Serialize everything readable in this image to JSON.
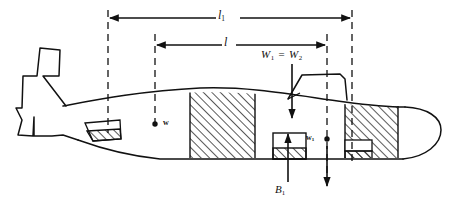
{
  "figure": {
    "background_color": "#ffffff",
    "line_color": "#111111",
    "hatch_color": "#1a1a1a"
  },
  "labels": {
    "length_overall": "l",
    "length_overall_sub": "1",
    "length_inner": "l",
    "weight_equation_lhs": "W",
    "weight_equation_lhs_sub": "1",
    "weight_equation_operator": "=",
    "weight_equation_rhs": "W",
    "weight_equation_rhs_sub": "2",
    "weight_center": "w",
    "weight_center_aft": "w",
    "weight_center_aft_sub": "1",
    "buoyancy": "B",
    "buoyancy_sub": "1"
  },
  "dimensions": {
    "overall_width_px": 451,
    "overall_height_px": 209,
    "dim_l1_left_x": 108,
    "dim_l1_right_x": 352,
    "dim_l1_y": 18,
    "dim_l_left_x": 155,
    "dim_l_right_x": 327,
    "dim_l_y": 45
  },
  "markers": [
    {
      "name": "center-of-weight-forward",
      "label": "w",
      "x": 155,
      "y": 124
    },
    {
      "name": "center-of-weight-aft",
      "label": "w1",
      "x": 327,
      "y": 139
    }
  ],
  "force_arrows": [
    {
      "name": "weight-arrow-down",
      "direction": "down",
      "x": 292,
      "from_y": 63,
      "to_y": 120
    },
    {
      "name": "weight-arrow-aft-down",
      "direction": "down",
      "x": 327,
      "from_y": 60,
      "to_y": 180
    },
    {
      "name": "buoyancy-arrow-up",
      "direction": "up",
      "x": 287,
      "from_y": 182,
      "to_y": 130
    }
  ],
  "compartments": [
    {
      "name": "aft-ballast-tank",
      "hatched": true
    },
    {
      "name": "midship-ballast-tank",
      "hatched": true
    },
    {
      "name": "buoyancy-tank",
      "hatched": true
    },
    {
      "name": "forward-ballast-tank",
      "hatched": true
    },
    {
      "name": "forward-trim-tank",
      "hatched": true
    }
  ],
  "structures": [
    {
      "name": "tail-fin-assembly"
    },
    {
      "name": "conning-tower"
    },
    {
      "name": "pressure-hull-outline"
    }
  ]
}
